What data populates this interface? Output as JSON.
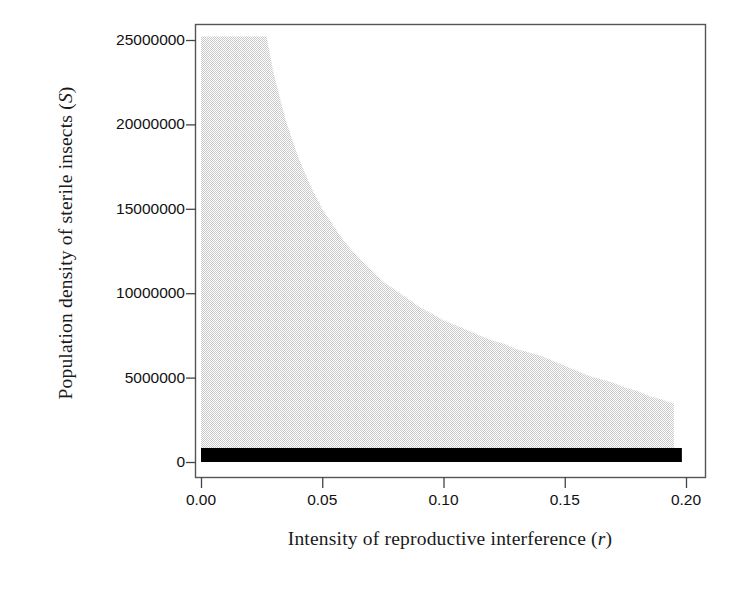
{
  "figure": {
    "background_color": "#ffffff",
    "frame_color": "#555555",
    "region_fill_color": "#e6e6e6",
    "extinction_band_color": "#000000"
  },
  "axes": {
    "x_title_prefix": "Intensity of reproductive interference (",
    "x_title_var": "r",
    "x_title_suffix": ")",
    "y_title_prefix": "Population density of sterile insects (",
    "y_title_var": "S",
    "y_title_suffix": ")"
  },
  "chart_data": {
    "type": "area",
    "title": "",
    "xlabel": "Intensity of reproductive interference (r)",
    "ylabel": "Population density of sterile insects (S)",
    "xlim": [
      0.0,
      0.2
    ],
    "ylim": [
      0,
      25000000
    ],
    "grid": false,
    "legend": "none",
    "x_ticks": [
      0.0,
      0.05,
      0.1,
      0.15,
      0.2
    ],
    "x_tick_labels": [
      "0.00",
      "0.05",
      "0.10",
      "0.15",
      "0.20"
    ],
    "y_ticks": [
      0,
      5000000,
      10000000,
      15000000,
      20000000,
      25000000
    ],
    "y_tick_labels": [
      "0",
      "5000000",
      "10000000",
      "15000000",
      "20000000",
      "25000000"
    ],
    "series": [
      {
        "name": "upper boundary of shaded region",
        "style": "filled-region-dithered-gray",
        "fill": "#e6e6e6",
        "x": [
          0.0,
          0.005,
          0.01,
          0.015,
          0.02,
          0.025,
          0.027,
          0.03,
          0.035,
          0.04,
          0.045,
          0.05,
          0.055,
          0.06,
          0.065,
          0.07,
          0.075,
          0.08,
          0.085,
          0.09,
          0.095,
          0.1,
          0.105,
          0.11,
          0.115,
          0.12,
          0.125,
          0.13,
          0.135,
          0.14,
          0.145,
          0.15,
          0.155,
          0.16,
          0.165,
          0.17,
          0.175,
          0.18,
          0.185,
          0.19,
          0.195
        ],
        "values": [
          25200000,
          25200000,
          25200000,
          25200000,
          25200000,
          25200000,
          25200000,
          23000000,
          20200000,
          18100000,
          16400000,
          15000000,
          13900000,
          12900000,
          12100000,
          11400000,
          10700000,
          10200000,
          9700000,
          9200000,
          8800000,
          8400000,
          8100000,
          7800000,
          7500000,
          7200000,
          7000000,
          6700000,
          6500000,
          6300000,
          6000000,
          5700000,
          5400000,
          5100000,
          4900000,
          4700000,
          4400000,
          4200000,
          3900000,
          3700000,
          3450000
        ]
      },
      {
        "name": "extinction band (lower black bar)",
        "style": "filled-region-solid-black",
        "fill": "#000000",
        "x": [
          0.0,
          0.195
        ],
        "y_lower": [
          0,
          0
        ],
        "y_upper": [
          830000,
          830000
        ]
      }
    ]
  },
  "ticks": {
    "y": [
      {
        "label": "25000000",
        "value": 25000000
      },
      {
        "label": "20000000",
        "value": 20000000
      },
      {
        "label": "15000000",
        "value": 15000000
      },
      {
        "label": "10000000",
        "value": 10000000
      },
      {
        "label": "5000000",
        "value": 5000000
      },
      {
        "label": "0",
        "value": 0
      }
    ],
    "x": [
      {
        "label": "0.00",
        "value": 0.0
      },
      {
        "label": "0.05",
        "value": 0.05
      },
      {
        "label": "0.10",
        "value": 0.1
      },
      {
        "label": "0.15",
        "value": 0.15
      },
      {
        "label": "0.20",
        "value": 0.2
      }
    ]
  }
}
